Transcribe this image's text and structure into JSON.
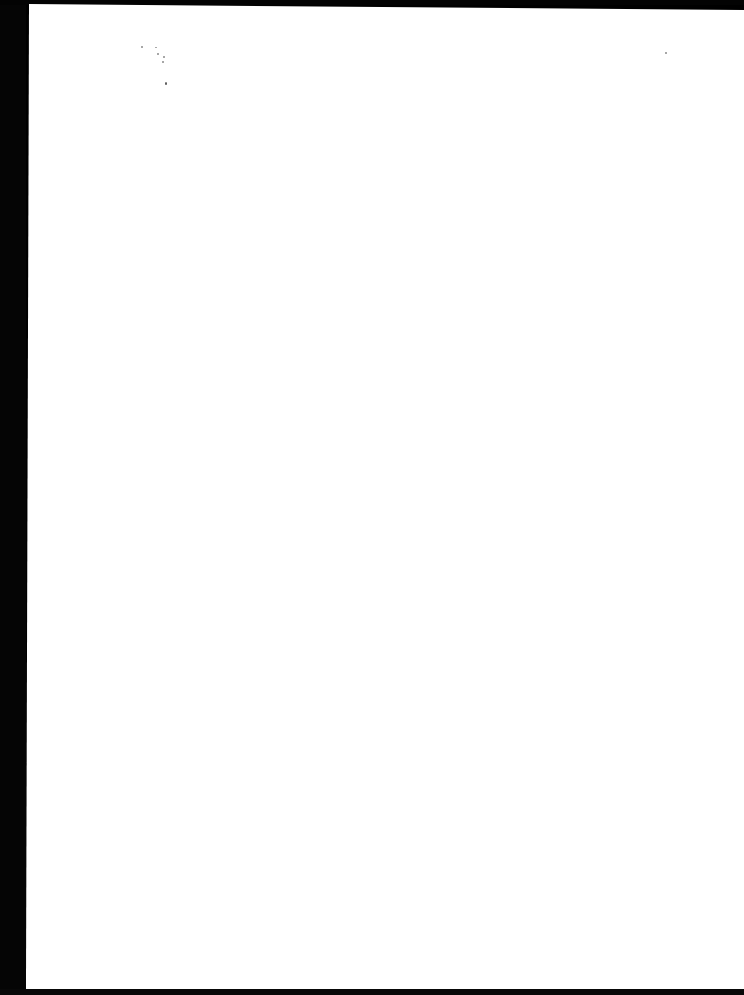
{
  "document": {
    "type": "scanned-page",
    "content": "",
    "page_color": "#ffffff",
    "scanner_background_color": "#000000"
  }
}
